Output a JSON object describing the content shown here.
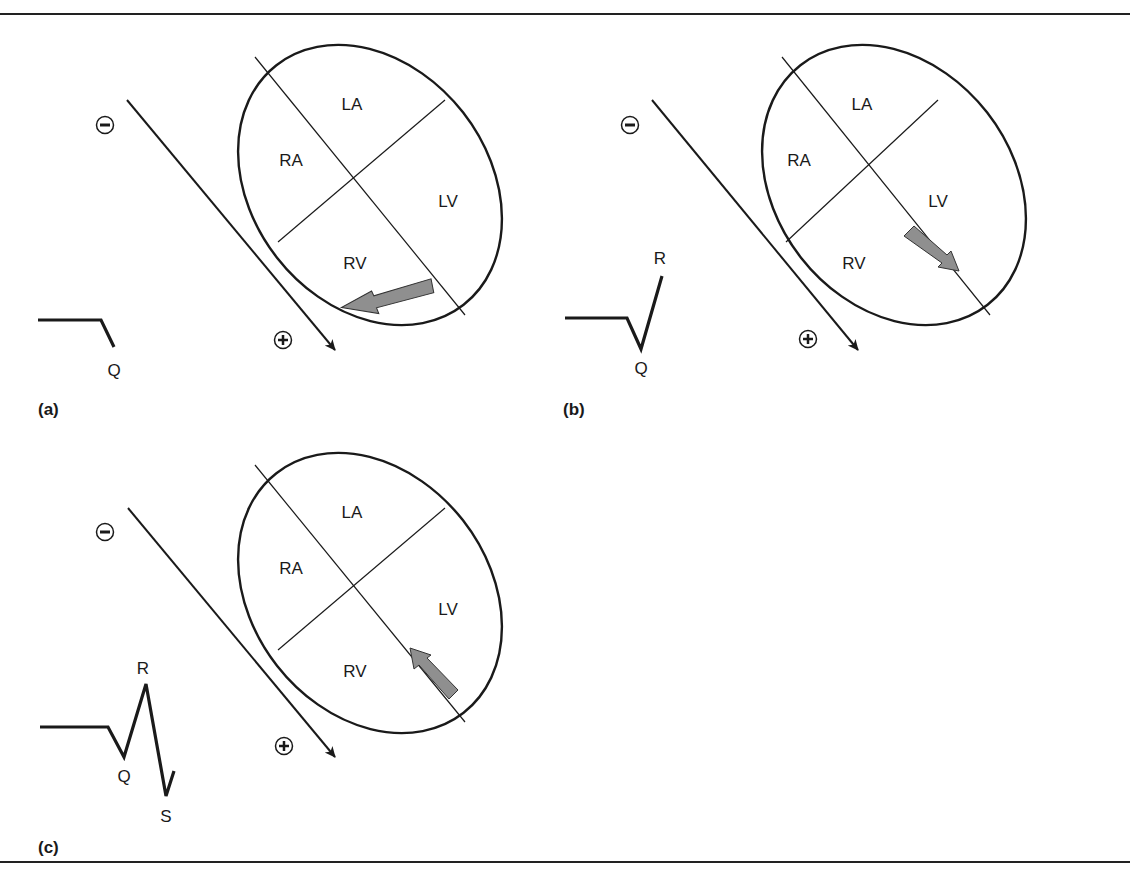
{
  "figure": {
    "rules": {
      "top_y": 14,
      "bottom_y": 862,
      "color": "#222222"
    },
    "colors": {
      "stroke": "#1a1a1a",
      "vector_fill": "#8f8f8f",
      "background": "#ffffff"
    },
    "chamber_labels": {
      "la": "LA",
      "ra": "RA",
      "lv": "LV",
      "rv": "RV"
    },
    "electrode": {
      "negative": "−",
      "positive": "+"
    },
    "panels": [
      {
        "id": "a",
        "label": "(a)",
        "wave_labels": {
          "q": "Q"
        },
        "vector_direction": "left (toward RV, away from positive electrode)",
        "waveform": "Q"
      },
      {
        "id": "b",
        "label": "(b)",
        "wave_labels": {
          "q": "Q",
          "r": "R"
        },
        "vector_direction": "down-right along septum toward apex",
        "waveform": "QR"
      },
      {
        "id": "c",
        "label": "(c)",
        "wave_labels": {
          "q": "Q",
          "r": "R",
          "s": "S"
        },
        "vector_direction": "up-left along septum toward base",
        "waveform": "QRS"
      }
    ]
  }
}
